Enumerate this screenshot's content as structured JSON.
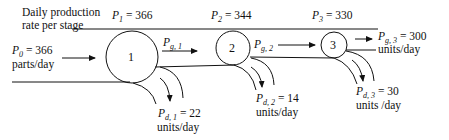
{
  "header": {
    "line1": "Daily production",
    "line2": "rate per stage"
  },
  "input": {
    "symbol": "P",
    "subscript": "0",
    "value": "= 366",
    "unit": "parts/day"
  },
  "stages": [
    {
      "number": "1",
      "rate_symbol": "P",
      "rate_sub": "1",
      "rate_value": "= 366",
      "good_symbol": "P",
      "good_sub": "g, 1",
      "good_value": "",
      "good_unit": "",
      "defect_symbol": "P",
      "defect_sub": "d, 1",
      "defect_value": "= 22",
      "defect_unit": "units/day"
    },
    {
      "number": "2",
      "rate_symbol": "P",
      "rate_sub": "2",
      "rate_value": "= 344",
      "good_symbol": "P",
      "good_sub": "g, 2",
      "good_value": "",
      "good_unit": "",
      "defect_symbol": "P",
      "defect_sub": "d, 2",
      "defect_value": "= 14",
      "defect_unit": "units/day"
    },
    {
      "number": "3",
      "rate_symbol": "P",
      "rate_sub": "3",
      "rate_value": "= 330",
      "good_symbol": "P",
      "good_sub": "g, 3",
      "good_value": "= 300",
      "good_unit": "units/day",
      "defect_symbol": "P",
      "defect_sub": "d, 3",
      "defect_value": "= 30",
      "defect_unit": "units /day"
    }
  ],
  "colors": {
    "ink": "#111111",
    "background": "#ffffff"
  }
}
